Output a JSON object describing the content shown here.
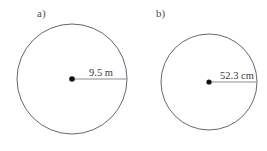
{
  "figure": {
    "background_color": "#ffffff",
    "stroke_color": "#55555c",
    "radius_line_color": "#8e8e93",
    "center_dot_color": "#111111",
    "text_color": "#3a3a3a",
    "parts": [
      {
        "key": "a",
        "part_label": "a)",
        "shape": "circle",
        "dimension_label": "9.5 m",
        "dimension_value": 9.5,
        "dimension_unit": "m",
        "dimension_type": "radius",
        "center_x": 72,
        "center_y": 79,
        "radius_px": 55
      },
      {
        "key": "b",
        "part_label": "b)",
        "shape": "circle",
        "dimension_label": "52.3 cm",
        "dimension_value": 52.3,
        "dimension_unit": "cm",
        "dimension_type": "radius",
        "center_x": 209,
        "center_y": 82,
        "radius_px": 48
      }
    ]
  }
}
